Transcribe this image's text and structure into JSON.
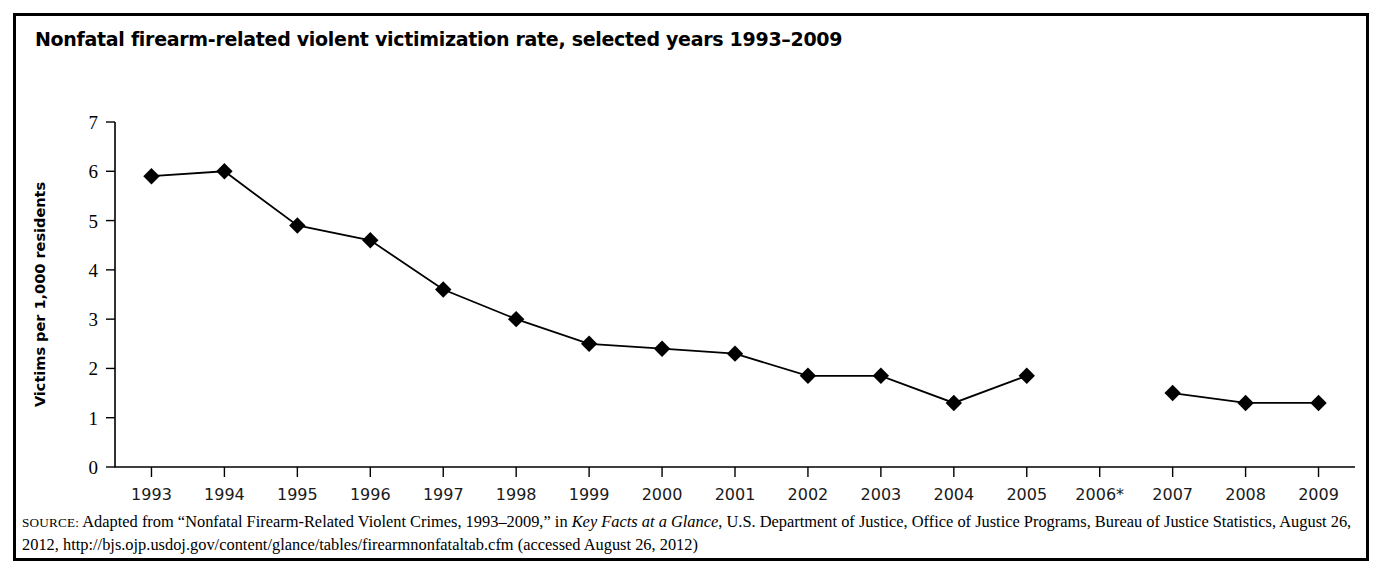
{
  "figure": {
    "title": "Nonfatal firearm-related violent victimization rate, selected years 1993–2009"
  },
  "source_note": {
    "label": "SOURCE:",
    "text_before_italic": " Adapted from “Nonfatal Firearm-Related Violent Crimes, 1993–2009,” in ",
    "italic_title": "Key Facts at a Glance",
    "text_after_italic": ", U.S. Department of Justice, Office of Justice Programs, Bureau of Justice Statistics, August 26, 2012, http://bjs.ojp.usdoj.gov/content/glance/tables/firearmnonfataltab.cfm (accessed August 26, 2012)"
  },
  "chart_data": {
    "type": "line",
    "title": "Nonfatal firearm-related violent victimization rate, selected years 1993–2009",
    "xlabel": "",
    "ylabel": "Victims per 1,000 residents",
    "ylim": [
      0,
      7
    ],
    "ytick_labels": [
      "0",
      "1",
      "2",
      "3",
      "4",
      "5",
      "6",
      "7"
    ],
    "ytick_values": [
      0,
      1,
      2,
      3,
      4,
      5,
      6,
      7
    ],
    "grid": false,
    "legend": "none",
    "marker": "filled-diamond",
    "categories": [
      "1993",
      "1994",
      "1995",
      "1996",
      "1997",
      "1998",
      "1999",
      "2000",
      "2001",
      "2002",
      "2003",
      "2004",
      "2005",
      "2006*",
      "2007",
      "2008",
      "2009"
    ],
    "values": [
      5.9,
      6.0,
      4.9,
      4.6,
      3.6,
      3.0,
      2.5,
      2.4,
      2.3,
      1.85,
      1.85,
      1.3,
      1.85,
      null,
      1.5,
      1.3,
      1.3
    ],
    "missing_note": "2006 data not available (marked with asterisk); line is broken between 2005 and 2007",
    "series": [
      {
        "name": "Nonfatal firearm-related violent victimization rate",
        "values": [
          5.9,
          6.0,
          4.9,
          4.6,
          3.6,
          3.0,
          2.5,
          2.4,
          2.3,
          1.85,
          1.85,
          1.3,
          1.85,
          null,
          1.5,
          1.3,
          1.3
        ]
      }
    ]
  }
}
